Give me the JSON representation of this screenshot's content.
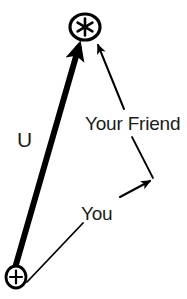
{
  "diagram": {
    "type": "vector-diagram",
    "background_color": "#ffffff",
    "stroke_color": "#000000",
    "text_color": "#1b1b1b",
    "width": 187,
    "height": 299,
    "nodes": [
      {
        "id": "star",
        "icon": "circled-asterisk-icon",
        "glyph": "✱",
        "x": 85,
        "y": 27,
        "rx": 15,
        "ry": 13
      },
      {
        "id": "origin",
        "icon": "circled-plus-icon",
        "glyph": "+",
        "x": 16,
        "y": 277,
        "rx": 10,
        "ry": 11
      }
    ],
    "vectors": [
      {
        "id": "u-vector",
        "label": "U",
        "from": "origin",
        "to": "star",
        "style": "thick",
        "stroke_width": 6,
        "x1": 15,
        "y1": 268,
        "x2": 79,
        "y2": 46
      },
      {
        "id": "your-friend-arrow",
        "label": "Your Friend",
        "style": "thin",
        "stroke_width": 2,
        "x1": 124,
        "y1": 109,
        "x2": 97,
        "y2": 44
      },
      {
        "id": "you-arrow",
        "label": "You",
        "style": "thin",
        "stroke_width": 2,
        "x1": 121,
        "y1": 196,
        "x2": 151,
        "y2": 180
      }
    ],
    "leaders": [
      {
        "id": "your-friend-leader",
        "from_label": "Your Friend",
        "x1": 132,
        "y1": 136,
        "x2": 153,
        "y2": 177
      },
      {
        "id": "you-leader",
        "from_label": "You",
        "x1": 82,
        "y1": 222,
        "x2": 26,
        "y2": 281
      }
    ],
    "labels": {
      "u": "U",
      "your_friend": "Your Friend",
      "you": "You"
    }
  }
}
